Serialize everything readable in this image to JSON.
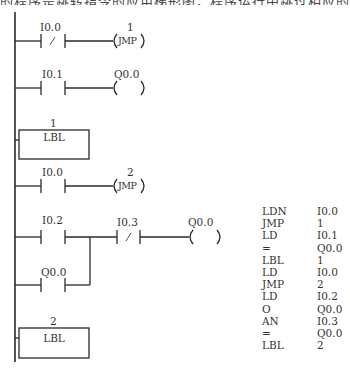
{
  "header": {
    "cut_text": "的程序是跳转指令的应用梯形图，程序运行中跳过相应的程序段后的程序"
  },
  "ladder": {
    "rungs": [
      {
        "contact_label": "I0.0",
        "contact_type": "normally-closed",
        "coil_label": "1",
        "coil_text": "JMP"
      },
      {
        "contact_label": "I0.1",
        "contact_type": "normally-open",
        "coil_label": "Q0.0",
        "coil_text": ""
      },
      {
        "box_label": "1",
        "box_text": "LBL"
      },
      {
        "contact_label": "I0.0",
        "contact_type": "normally-open",
        "coil_label": "2",
        "coil_text": "JMP"
      },
      {
        "contact_label": "I0.2",
        "contact_type": "normally-open",
        "series_label": "I0.3",
        "series_type": "normally-closed",
        "coil_label": "Q0.0",
        "coil_text": "",
        "parallel_label": "Q0.0",
        "parallel_type": "normally-open"
      },
      {
        "box_label": "2",
        "box_text": "LBL"
      }
    ],
    "nc_slash": "/"
  },
  "instruction_list": [
    {
      "op": "LDN",
      "arg": "I0.0"
    },
    {
      "op": "JMP",
      "arg": "1"
    },
    {
      "op": "LD",
      "arg": "I0.1"
    },
    {
      "op": "=",
      "arg": "Q0.0"
    },
    {
      "op": "LBL",
      "arg": "1"
    },
    {
      "op": "LD",
      "arg": "I0.0"
    },
    {
      "op": "JMP",
      "arg": "2"
    },
    {
      "op": "LD",
      "arg": "I0.2"
    },
    {
      "op": "O",
      "arg": "Q0.0"
    },
    {
      "op": "AN",
      "arg": "I0.3"
    },
    {
      "op": "=",
      "arg": "Q0.0"
    },
    {
      "op": "LBL",
      "arg": "2"
    }
  ],
  "colors": {
    "line": "#2a2a2a",
    "background": "#ffffff"
  }
}
